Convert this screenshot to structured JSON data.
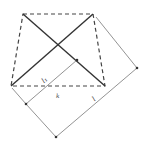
{
  "diagram": {
    "colors": {
      "background": "#ffffff",
      "solid_stroke": "#333333",
      "dashed_stroke": "#444444",
      "thin_stroke": "#777777"
    },
    "quadrilateral": {
      "points": [
        [
          23,
          14
        ],
        [
          93,
          14
        ],
        [
          105,
          86
        ],
        [
          11,
          86
        ]
      ],
      "style": "dashed"
    },
    "diagonals": [
      {
        "from": [
          23,
          14
        ],
        "to": [
          105,
          86
        ]
      },
      {
        "from": [
          11,
          86
        ],
        "to": [
          93,
          14
        ]
      }
    ],
    "thin_lines": [
      {
        "from": [
          77,
          60
        ],
        "to": [
          26,
          104
        ]
      },
      {
        "from": [
          96,
          17
        ],
        "to": [
          137,
          68
        ]
      },
      {
        "from": [
          137,
          68
        ],
        "to": [
          56,
          137
        ]
      },
      {
        "from": [
          56,
          137
        ],
        "to": [
          26,
          104
        ]
      },
      {
        "from": [
          26,
          104
        ],
        "to": [
          12,
          88
        ]
      }
    ],
    "points": [
      {
        "name": "p1",
        "at": [
          77,
          60
        ]
      },
      {
        "name": "p2",
        "at": [
          137,
          68
        ]
      },
      {
        "name": "p3",
        "at": [
          26,
          104
        ]
      },
      {
        "name": "p4",
        "at": [
          56,
          137
        ]
      }
    ],
    "labels": {
      "l1": "l₁",
      "l": "l",
      "k": "k"
    }
  }
}
